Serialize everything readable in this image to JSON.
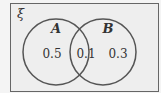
{
  "diagram": {
    "type": "venn",
    "universal_label": "ξ",
    "sets": [
      {
        "label": "A",
        "region_value": "0.5"
      },
      {
        "label": "B",
        "region_value": "0.3"
      }
    ],
    "intersection_value": "0.1",
    "colors": {
      "background": "#eeeeee",
      "stroke": "#555555",
      "text": "#333333"
    }
  }
}
